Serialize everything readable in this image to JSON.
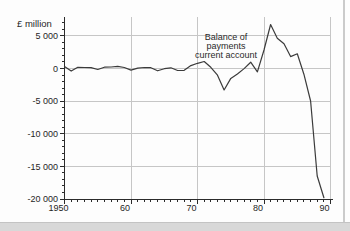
{
  "chart_data": {
    "type": "line",
    "title": "",
    "ylabel": "£ million",
    "annotation_lines": [
      "Balance of",
      "payments",
      "current account"
    ],
    "xlim": [
      1950,
      1990
    ],
    "ylim": [
      -20000,
      7000
    ],
    "grid": "major",
    "legend": "none",
    "x_ticks": [
      1950,
      1960,
      1970,
      1980,
      1990
    ],
    "x_tick_labels": [
      "1950",
      "60",
      "70",
      "80",
      "90"
    ],
    "x_minor_step": 1,
    "y_ticks": [
      5000,
      0,
      -5000,
      -10000,
      -15000,
      -20000
    ],
    "y_tick_labels": [
      "5 000",
      "0",
      "-5 000",
      "-10 000",
      "-15 000",
      "-20 000"
    ],
    "y_minor_step": 1000,
    "series": [
      {
        "name": "Balance of payments current account",
        "x": [
          1950,
          1951,
          1952,
          1953,
          1954,
          1955,
          1956,
          1957,
          1958,
          1959,
          1960,
          1961,
          1962,
          1963,
          1964,
          1965,
          1966,
          1967,
          1968,
          1969,
          1970,
          1971,
          1972,
          1973,
          1974,
          1975,
          1976,
          1977,
          1978,
          1979,
          1980,
          1981,
          1982,
          1983,
          1984,
          1985,
          1986,
          1987,
          1988,
          1989
        ],
        "values": [
          300,
          -400,
          180,
          150,
          120,
          -150,
          200,
          230,
          340,
          150,
          -250,
          50,
          150,
          120,
          -360,
          -30,
          100,
          -300,
          -280,
          440,
          790,
          1080,
          190,
          -1020,
          -3300,
          -1520,
          -850,
          -20,
          970,
          -500,
          2840,
          6750,
          4650,
          3790,
          1830,
          2250,
          -880,
          -4980,
          -16480,
          -19800
        ]
      }
    ],
    "colors": {
      "line": "#3b3b3b",
      "axis": "#2b2b2b",
      "grid": "#c6c6c6",
      "text": "#1f1f1f"
    }
  }
}
